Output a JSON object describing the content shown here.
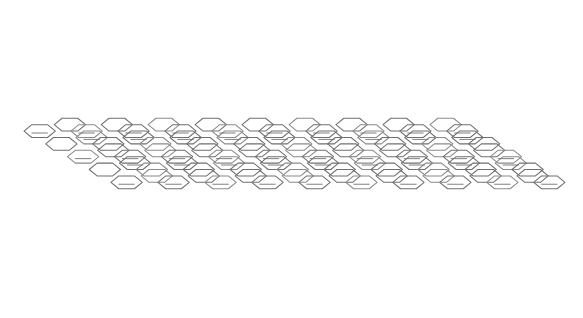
{
  "figure": {
    "kind": "molecular-structure-diagram",
    "background_color": "#ffffff",
    "canvas": {
      "width": 583,
      "height": 318
    }
  },
  "style": {
    "bond_color": "#6f6f6f",
    "bond_color_light": "#8a8a8a",
    "bond_width": 1.05,
    "inner_bond_color": "#707070",
    "inner_bond_width": 1.0,
    "ring_fill": "#ffffff"
  },
  "lattice": {
    "type": "honeycomb-sheared",
    "rows": 5,
    "cols": 19,
    "hex_half_width": 17.6,
    "hex_half_height": 7.2,
    "hex_shoulder": 8.8,
    "col_step_x": 26.4,
    "col_step_y": 0.0,
    "row_step_x": 13.2,
    "row_step_y": 14.4,
    "origin_x": 42.0,
    "origin_y": 66.0,
    "shear_x": 0.78,
    "stagger_x": 13.2,
    "stagger_y": 7.2,
    "global_skew": 0.0
  },
  "inner_bonds": {
    "enabled": true,
    "inset": 0.3,
    "length_ratio": 0.52,
    "pattern_note": "Kekule double-bond marks on alternating rings along each row",
    "period": 2,
    "offsets": [
      0,
      1,
      0,
      1,
      0
    ]
  },
  "extents": {
    "left_vertex_x": 24,
    "top_vertex_y": 17,
    "right_vertex_x": 565,
    "bottom_vertex_y": 290
  },
  "labels": {
    "figure_title": "",
    "axis_label": "",
    "legend": ""
  },
  "chart_data": {
    "type": "diagram",
    "categories": [],
    "values": [],
    "series": [],
    "xlabel": "",
    "ylabel": ""
  }
}
